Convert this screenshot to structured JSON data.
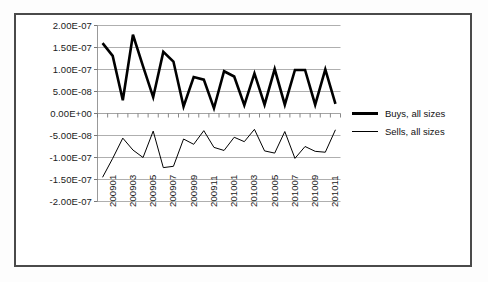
{
  "chart_data": {
    "type": "line",
    "title": "",
    "xlabel": "",
    "ylabel": "",
    "grid": true,
    "legend_position": "right",
    "ylim": [
      -2e-07,
      2e-07
    ],
    "ytick_labels": [
      "2.00E-07",
      "1.50E-07",
      "1.00E-07",
      "5.00E-08",
      "0.00E+00",
      "-5.00E-08",
      "-1.00E-07",
      "-1.50E-07",
      "-2.00E-07"
    ],
    "ytick_values": [
      2e-07,
      1.5e-07,
      1e-07,
      5e-08,
      0,
      -5e-08,
      -1e-07,
      -1.5e-07,
      -2e-07
    ],
    "categories": [
      "200901",
      "200902",
      "200903",
      "200904",
      "200905",
      "200906",
      "200907",
      "200908",
      "200909",
      "200910",
      "200911",
      "200912",
      "201001",
      "201002",
      "201003",
      "201004",
      "201005",
      "201006",
      "201007",
      "201008",
      "201009",
      "201010",
      "201011",
      "201012"
    ],
    "xtick_labels": [
      "200901",
      "200903",
      "200905",
      "200907",
      "200909",
      "200911",
      "201001",
      "201003",
      "201005",
      "201007",
      "201009",
      "201011"
    ],
    "series": [
      {
        "name": "Buys, all sizes",
        "color": "#000000",
        "line_width": 2.6,
        "values": [
          1.6e-07,
          1.31e-07,
          3e-08,
          1.79e-07,
          1.07e-07,
          3.7e-08,
          1.4e-07,
          1.18e-07,
          1.6e-08,
          8.3e-08,
          7.7e-08,
          1.2e-08,
          9.6e-08,
          8.4e-08,
          1.9e-08,
          9.1e-08,
          2e-08,
          1.01e-07,
          2e-08,
          9.9e-08,
          9.9e-08,
          2e-08,
          1e-07,
          2.2e-08
        ]
      },
      {
        "name": "Sells, all sizes",
        "color": "#000000",
        "line_width": 1.0,
        "values": [
          -1.45e-07,
          -1.02e-07,
          -5.6e-08,
          -8.3e-08,
          -1e-07,
          -4e-08,
          -1.23e-07,
          -1.2e-07,
          -5.8e-08,
          -7e-08,
          -3.9e-08,
          -7.7e-08,
          -8.4e-08,
          -5.4e-08,
          -6.4e-08,
          -3.6e-08,
          -8.5e-08,
          -9e-08,
          -4.1e-08,
          -1.02e-07,
          -7.5e-08,
          -8.6e-08,
          -8.8e-08,
          -3.7e-08
        ]
      }
    ]
  },
  "legend": {
    "entries": [
      {
        "label": "Buys, all sizes",
        "style": "thick"
      },
      {
        "label": "Sells, all sizes",
        "style": "thin"
      }
    ]
  }
}
